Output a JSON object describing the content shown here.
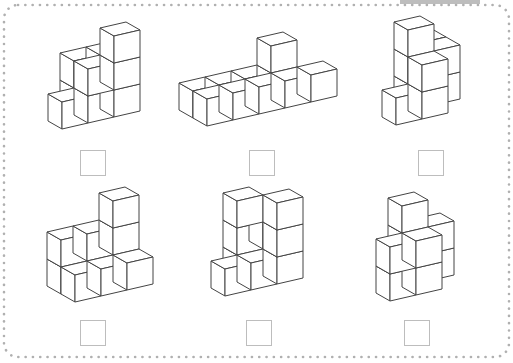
{
  "worksheet": {
    "title": "Count the cubes",
    "border_style": "dotted",
    "border_color": "#b0b0b0",
    "line_color": "#444444"
  },
  "cube_geometry": {
    "w": [
      26,
      -6
    ],
    "d": [
      -14,
      -8
    ],
    "h": 27
  },
  "figures": [
    {
      "id": "figure-1",
      "origin": [
        62,
        129
      ],
      "cubes": [
        [
          0,
          0,
          0
        ],
        [
          1,
          0,
          0
        ],
        [
          2,
          0,
          0
        ],
        [
          1,
          0,
          1
        ],
        [
          2,
          0,
          1
        ],
        [
          2,
          0,
          2
        ],
        [
          1,
          1,
          0
        ],
        [
          1,
          1,
          1
        ],
        [
          2,
          1,
          0
        ],
        [
          2,
          1,
          1
        ]
      ],
      "answer_box": {
        "x": 80,
        "y": 150,
        "value": ""
      }
    },
    {
      "id": "figure-2",
      "origin": [
        207,
        126
      ],
      "cubes": [
        [
          0,
          0,
          0
        ],
        [
          1,
          0,
          0
        ],
        [
          2,
          0,
          0
        ],
        [
          3,
          0,
          0
        ],
        [
          0,
          1,
          0
        ],
        [
          1,
          1,
          0
        ],
        [
          2,
          1,
          0
        ],
        [
          3,
          1,
          0
        ],
        [
          3,
          1,
          1
        ],
        [
          4,
          0,
          0
        ]
      ],
      "answer_box": {
        "x": 249,
        "y": 150,
        "value": ""
      }
    },
    {
      "id": "figure-3",
      "origin": [
        396,
        125
      ],
      "cubes": [
        [
          0,
          0,
          0
        ],
        [
          1,
          0,
          0
        ],
        [
          1,
          0,
          1
        ],
        [
          1,
          1,
          0
        ],
        [
          1,
          1,
          1
        ],
        [
          1,
          1,
          2
        ],
        [
          2,
          1,
          0
        ],
        [
          2,
          1,
          1
        ],
        [
          2,
          2,
          0
        ],
        [
          2,
          2,
          1
        ]
      ],
      "answer_box": {
        "x": 418,
        "y": 150,
        "value": ""
      }
    },
    {
      "id": "figure-4",
      "origin": [
        75,
        302
      ],
      "cubes": [
        [
          0,
          0,
          0
        ],
        [
          1,
          0,
          0
        ],
        [
          2,
          0,
          0
        ],
        [
          0,
          1,
          0
        ],
        [
          0,
          1,
          1
        ],
        [
          1,
          1,
          0
        ],
        [
          1,
          1,
          1
        ],
        [
          2,
          1,
          0
        ],
        [
          2,
          1,
          1
        ],
        [
          2,
          1,
          2
        ]
      ],
      "answer_box": {
        "x": 80,
        "y": 320,
        "value": ""
      }
    },
    {
      "id": "figure-5",
      "origin": [
        225,
        296
      ],
      "cubes": [
        [
          0,
          0,
          0
        ],
        [
          1,
          0,
          0
        ],
        [
          2,
          0,
          0
        ],
        [
          2,
          0,
          1
        ],
        [
          2,
          0,
          2
        ],
        [
          1,
          1,
          0
        ],
        [
          1,
          1,
          1
        ],
        [
          1,
          1,
          2
        ],
        [
          2,
          1,
          0
        ],
        [
          2,
          1,
          1
        ]
      ],
      "answer_box": {
        "x": 246,
        "y": 320,
        "value": ""
      }
    },
    {
      "id": "figure-6",
      "origin": [
        390,
        301
      ],
      "cubes": [
        [
          0,
          0,
          0
        ],
        [
          0,
          0,
          1
        ],
        [
          1,
          0,
          0
        ],
        [
          1,
          0,
          1
        ],
        [
          1,
          1,
          0
        ],
        [
          1,
          1,
          1
        ],
        [
          1,
          1,
          2
        ],
        [
          2,
          1,
          0
        ],
        [
          2,
          1,
          1
        ],
        [
          2,
          2,
          0
        ]
      ],
      "answer_box": {
        "x": 404,
        "y": 320,
        "value": ""
      }
    }
  ]
}
